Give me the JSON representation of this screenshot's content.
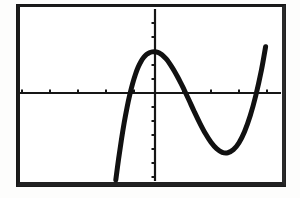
{
  "figure": {
    "kind": "graphing-calculator-screen",
    "background_color": "#ffffff",
    "frame_color": "#1b1b1b",
    "curve_color": "#111111",
    "axis_color": "#161616",
    "alt_text": "Graphing calculator screen showing the graph of a cubic polynomial with a local maximum on the y-axis, a local minimum to the right, and three x-intercepts."
  },
  "chart_data": {
    "type": "line",
    "title": "",
    "subtitle": "",
    "xlabel": "",
    "ylabel": "",
    "grid": false,
    "legend": null,
    "legend_position": "none",
    "xlim": [
      -5,
      5
    ],
    "ylim": [
      -6,
      6
    ],
    "xtick_step": 1,
    "ytick_step": 1,
    "xticks": [
      -5,
      -4,
      -3,
      -2,
      -1,
      1,
      2,
      3,
      4,
      5
    ],
    "yticks": [
      -6,
      -5,
      -4,
      -3,
      -2,
      -1,
      1,
      2,
      3,
      4,
      5,
      6
    ],
    "tick_labels_shown": false,
    "axis_labels_shown": false,
    "series": [
      {
        "name": "cubic",
        "color": "#111111",
        "x": [
          -1.4,
          -1.3,
          -1.2,
          -1.1,
          -1.0,
          -0.9,
          -0.8,
          -0.7,
          -0.6,
          -0.5,
          -0.4,
          -0.3,
          -0.2,
          -0.1,
          0.0,
          0.1,
          0.2,
          0.3,
          0.4,
          0.5,
          0.6,
          0.7,
          0.8,
          0.9,
          1.0,
          1.2,
          1.4,
          1.6,
          1.8,
          2.0,
          2.2,
          2.4,
          2.6,
          2.8,
          3.0,
          3.2,
          3.4,
          3.6,
          3.8,
          3.95
        ],
        "y": [
          -6.2,
          -4.7,
          -3.35,
          -2.12,
          -1.05,
          -0.12,
          0.67,
          1.32,
          1.85,
          2.25,
          2.55,
          2.76,
          2.88,
          2.94,
          2.95,
          2.9,
          2.8,
          2.64,
          2.43,
          2.17,
          1.87,
          1.54,
          1.18,
          0.8,
          0.4,
          -0.45,
          -1.32,
          -2.15,
          -2.9,
          -3.52,
          -3.98,
          -4.24,
          -4.27,
          -4.05,
          -3.55,
          -2.75,
          -1.63,
          -0.18,
          1.62,
          3.3
        ],
        "annotations": {
          "local_maximum": {
            "x": -0.05,
            "y": 2.95
          },
          "local_minimum": {
            "x": 2.55,
            "y": -4.28
          },
          "x_intercepts": [
            -0.92,
            1.1,
            3.62
          ],
          "y_intercept": 2.95
        }
      }
    ]
  },
  "geometry": {
    "frame": {
      "x": 16,
      "y": 4,
      "width": 270,
      "height": 183
    },
    "axes_origin": {
      "x": 155,
      "y": 93
    },
    "x_axis": {
      "x1": 19,
      "x2": 281,
      "y": 93
    },
    "y_axis": {
      "x": 155,
      "y1": 9,
      "y2": 181
    },
    "x_tick_spacing_px": 28,
    "y_tick_spacing_px": 14,
    "curve_stroke_width_px": 5
  }
}
